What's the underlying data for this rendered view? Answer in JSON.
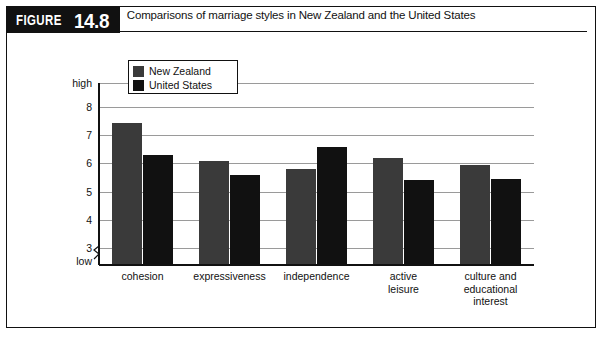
{
  "figure": {
    "word": "FIGURE",
    "number": "14.8",
    "caption": "Comparisons of marriage styles in New Zealand and the United States"
  },
  "chart_data": {
    "type": "bar",
    "title": "Comparisons of marriage styles in New Zealand and the United States",
    "xlabel": "",
    "ylabel": "",
    "grid": true,
    "legend_position": "top-left inside plot",
    "categories": [
      "cohesion",
      "expressiveness",
      "independence",
      "active leisure",
      "culture and educational interest"
    ],
    "category_lines": [
      [
        "cohesion"
      ],
      [
        "expressiveness"
      ],
      [
        "independence"
      ],
      [
        "active",
        "leisure"
      ],
      [
        "culture and",
        "educational",
        "interest"
      ]
    ],
    "series": [
      {
        "name": "New Zealand",
        "color": "#3a3a3a",
        "values": [
          7.45,
          6.1,
          5.8,
          6.2,
          5.95
        ]
      },
      {
        "name": "United States",
        "color": "#111111",
        "values": [
          6.3,
          5.6,
          6.6,
          5.4,
          5.45
        ]
      }
    ],
    "ylim": [
      2.4,
      8.85
    ],
    "yticks": [
      {
        "value": 8.85,
        "label": "high"
      },
      {
        "value": 8,
        "label": "8"
      },
      {
        "value": 7,
        "label": "7"
      },
      {
        "value": 6,
        "label": "6"
      },
      {
        "value": 5,
        "label": "5"
      },
      {
        "value": 4,
        "label": "4"
      },
      {
        "value": 3,
        "label": "3"
      },
      {
        "value": 2.55,
        "label": "low"
      }
    ],
    "gridline_values": [
      8.85,
      8,
      7,
      6,
      5,
      4,
      3
    ]
  },
  "legend": {
    "items": [
      {
        "label": "New Zealand"
      },
      {
        "label": "United States"
      }
    ]
  }
}
